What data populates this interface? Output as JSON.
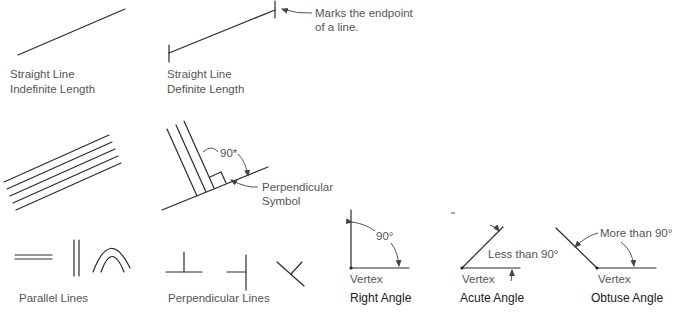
{
  "diagram": {
    "panels": {
      "indefinite_line": {
        "label_line1": "Straight Line",
        "label_line2": "Indefinite Length"
      },
      "definite_line": {
        "label_line1": "Straight Line",
        "label_line2": "Definite Length",
        "callout_line1": "Marks the endpoint",
        "callout_line2": "of a line."
      },
      "parallel_set": {
        "line_count": 5
      },
      "perpendicular_symbol": {
        "angle_label": "90*",
        "callout_line1": "Perpendicular",
        "callout_line2": "Symbol"
      },
      "parallel_lines": {
        "label": "Parallel Lines"
      },
      "perpendicular_lines": {
        "label": "Perpendicular Lines"
      },
      "right_angle": {
        "angle_label": "90°",
        "vertex_label": "Vertex",
        "title": "Right Angle"
      },
      "acute_angle": {
        "angle_label": "Less than 90°",
        "vertex_label": "Vertex",
        "title": "Acute Angle"
      },
      "obtuse_angle": {
        "angle_label": "More than 90°",
        "vertex_label": "Vertex",
        "title": "Obtuse Angle"
      }
    },
    "colors": {
      "line": "#2b2b2b",
      "label": "#555555",
      "title": "#1a1a1a",
      "background": "#ffffff"
    }
  }
}
